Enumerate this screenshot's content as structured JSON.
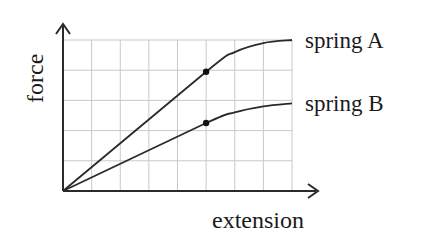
{
  "chart_data": {
    "type": "line",
    "title": "",
    "xlabel": "extension",
    "ylabel": "force",
    "grid": true,
    "grid_columns": 8,
    "grid_rows": 5,
    "xlim": [
      0,
      8
    ],
    "ylim": [
      0,
      5
    ],
    "x_ticks": [],
    "y_ticks": [],
    "legend_position": "inline-right",
    "series": [
      {
        "name": "spring A",
        "label": "spring A",
        "points": [
          [
            0,
            0
          ],
          [
            5,
            3.95
          ],
          [
            6,
            4.6
          ],
          [
            7,
            4.9
          ],
          [
            8,
            5.0
          ]
        ],
        "marker": {
          "x": 5,
          "y": 3.95,
          "note": "limit of proportionality"
        }
      },
      {
        "name": "spring B",
        "label": "spring B",
        "points": [
          [
            0,
            0
          ],
          [
            5,
            2.25
          ],
          [
            6,
            2.6
          ],
          [
            7,
            2.8
          ],
          [
            8,
            2.9
          ]
        ],
        "marker": {
          "x": 5,
          "y": 2.25,
          "note": "limit of proportionality"
        }
      }
    ],
    "colors": {
      "line": "#2a2a2a",
      "axis": "#2a2a2a",
      "grid": "#c8c8c8",
      "background": "#ffffff"
    }
  }
}
